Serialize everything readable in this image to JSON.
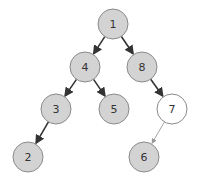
{
  "diagram": {
    "type": "binary-tree",
    "nodes": [
      {
        "id": "1",
        "label": "1",
        "style": "filled"
      },
      {
        "id": "4",
        "label": "4",
        "style": "filled"
      },
      {
        "id": "8",
        "label": "8",
        "style": "filled"
      },
      {
        "id": "3",
        "label": "3",
        "style": "filled"
      },
      {
        "id": "5",
        "label": "5",
        "style": "filled"
      },
      {
        "id": "7",
        "label": "7",
        "style": "unfilled"
      },
      {
        "id": "2",
        "label": "2",
        "style": "filled"
      },
      {
        "id": "6",
        "label": "6",
        "style": "filled"
      }
    ],
    "edges": [
      {
        "from": "1",
        "to": "4",
        "style": "bold"
      },
      {
        "from": "1",
        "to": "8",
        "style": "bold"
      },
      {
        "from": "4",
        "to": "3",
        "style": "bold"
      },
      {
        "from": "4",
        "to": "5",
        "style": "bold"
      },
      {
        "from": "8",
        "to": "7",
        "style": "bold"
      },
      {
        "from": "3",
        "to": "2",
        "style": "bold"
      },
      {
        "from": "7",
        "to": "6",
        "style": "light"
      }
    ],
    "colors": {
      "filled_node": "#d3d3d3",
      "unfilled_node": "#ffffff",
      "node_stroke": "#8a8a8a",
      "bold_edge": "#333333",
      "light_edge": "#999999"
    }
  }
}
